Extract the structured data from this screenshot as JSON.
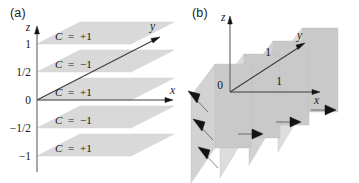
{
  "figure": {
    "background_color": "#ffffff",
    "plane_fill_color": "#d9d9d9",
    "arrow_color": "#131313",
    "axis_color": "#6f6f6f"
  },
  "panel_a": {
    "label": "(a)",
    "axes": {
      "z_label": "z",
      "x_label": "x",
      "y_label": "y"
    },
    "z_ticks": [
      {
        "value": 1,
        "text": "1"
      },
      {
        "value": 0.5,
        "text": "1/2"
      },
      {
        "value": 0,
        "text": "0"
      },
      {
        "value": -0.5,
        "text": "−1/2"
      },
      {
        "value": -1,
        "text": "−1"
      }
    ],
    "planes": [
      {
        "z": 1,
        "label_var": "C",
        "label_eq": "=",
        "label_value": "+1"
      },
      {
        "z": 0.5,
        "label_var": "C",
        "label_eq": "=",
        "label_value": "−1"
      },
      {
        "z": 0,
        "label_var": "C",
        "label_eq": "=",
        "label_value": "+1"
      },
      {
        "z": -0.5,
        "label_var": "C",
        "label_eq": "=",
        "label_value": "−1"
      },
      {
        "z": -1,
        "label_var": "C",
        "label_eq": "=",
        "label_value": "+1"
      }
    ]
  },
  "panel_b": {
    "label": "(b)",
    "axes": {
      "z_label": "z",
      "x_label": "x",
      "y_label": "y",
      "origin_label": "0",
      "x_tick_label": "1",
      "y_tick_label": "1"
    },
    "planes": [
      {
        "index": 0,
        "arrow_direction": "up-left"
      },
      {
        "index": 1,
        "arrow_direction": "right"
      },
      {
        "index": 2,
        "arrow_direction": "right"
      },
      {
        "index": 3,
        "arrow_direction": "right"
      }
    ],
    "arrows": [
      {
        "plane": 0,
        "direction": "up-left"
      },
      {
        "plane": 0,
        "direction": "up-left"
      },
      {
        "plane": 0,
        "direction": "up-left"
      },
      {
        "plane": 1,
        "direction": "right"
      },
      {
        "plane": 2,
        "direction": "right"
      },
      {
        "plane": 3,
        "direction": "right"
      }
    ]
  }
}
